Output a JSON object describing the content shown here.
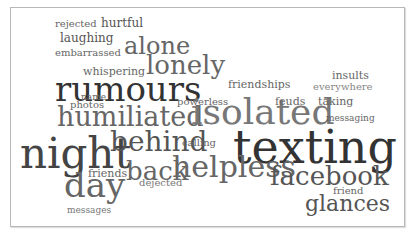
{
  "word_cloud": {
    "words": [
      {
        "text": "rejected",
        "x": 55,
        "y": 19,
        "size": 10,
        "color": "#666666"
      },
      {
        "text": "hurtful",
        "x": 101,
        "y": 17,
        "size": 12,
        "color": "#555555"
      },
      {
        "text": "laughing",
        "x": 60,
        "y": 32,
        "size": 12,
        "color": "#555555"
      },
      {
        "text": "embarrassed",
        "x": 55,
        "y": 48,
        "size": 10,
        "color": "#666666"
      },
      {
        "text": "alone",
        "x": 124,
        "y": 34,
        "size": 24,
        "color": "#666666"
      },
      {
        "text": "whispering",
        "x": 83,
        "y": 66,
        "size": 11,
        "color": "#666666"
      },
      {
        "text": "lonely",
        "x": 146,
        "y": 52,
        "size": 26,
        "color": "#666666"
      },
      {
        "text": "rumours",
        "x": 55,
        "y": 72,
        "size": 34,
        "color": "#333333"
      },
      {
        "text": "name",
        "x": 81,
        "y": 93,
        "size": 9,
        "color": "#666666"
      },
      {
        "text": "photos",
        "x": 70,
        "y": 100,
        "size": 10,
        "color": "#666666"
      },
      {
        "text": "humiliated",
        "x": 57,
        "y": 103,
        "size": 27,
        "color": "#666666"
      },
      {
        "text": "powerless",
        "x": 177,
        "y": 97,
        "size": 10,
        "color": "#666666"
      },
      {
        "text": "isolated",
        "x": 191,
        "y": 94,
        "size": 36,
        "color": "#777777"
      },
      {
        "text": "friendships",
        "x": 228,
        "y": 79,
        "size": 11,
        "color": "#666666"
      },
      {
        "text": "insults",
        "x": 332,
        "y": 70,
        "size": 11,
        "color": "#666666"
      },
      {
        "text": "everywhere",
        "x": 313,
        "y": 82,
        "size": 10,
        "color": "#888888"
      },
      {
        "text": "feuds",
        "x": 275,
        "y": 96,
        "size": 11,
        "color": "#666666"
      },
      {
        "text": "taking",
        "x": 318,
        "y": 96,
        "size": 11,
        "color": "#666666"
      },
      {
        "text": "messaging",
        "x": 326,
        "y": 114,
        "size": 9,
        "color": "#666666"
      },
      {
        "text": "night",
        "x": 20,
        "y": 133,
        "size": 42,
        "color": "#444444"
      },
      {
        "text": "behind",
        "x": 110,
        "y": 128,
        "size": 28,
        "color": "#555555"
      },
      {
        "text": "calling",
        "x": 182,
        "y": 138,
        "size": 10,
        "color": "#666666"
      },
      {
        "text": "texting",
        "x": 233,
        "y": 124,
        "size": 46,
        "color": "#333333"
      },
      {
        "text": "back",
        "x": 126,
        "y": 158,
        "size": 26,
        "color": "#666666"
      },
      {
        "text": "helpless",
        "x": 172,
        "y": 152,
        "size": 30,
        "color": "#666666"
      },
      {
        "text": "friends",
        "x": 88,
        "y": 168,
        "size": 11,
        "color": "#666666"
      },
      {
        "text": "dejected",
        "x": 139,
        "y": 178,
        "size": 10,
        "color": "#777777"
      },
      {
        "text": "day",
        "x": 64,
        "y": 168,
        "size": 34,
        "color": "#666666"
      },
      {
        "text": "facebook",
        "x": 270,
        "y": 163,
        "size": 26,
        "color": "#555555"
      },
      {
        "text": "friend",
        "x": 333,
        "y": 186,
        "size": 10,
        "color": "#666666"
      },
      {
        "text": "glances",
        "x": 305,
        "y": 193,
        "size": 22,
        "color": "#555555"
      },
      {
        "text": "messages",
        "x": 67,
        "y": 206,
        "size": 9,
        "color": "#777777"
      }
    ],
    "frame_border_color": "#b8b8b8",
    "background": "#ffffff"
  }
}
